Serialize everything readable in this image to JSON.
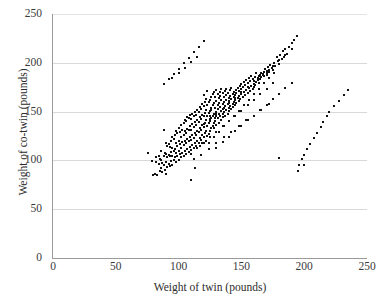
{
  "chart_data": {
    "type": "scatter",
    "title": "",
    "xlabel": "Weight of twin (pounds)",
    "ylabel": "Weight of co-twin (pounds)",
    "xlim": [
      0,
      250
    ],
    "ylim": [
      0,
      250
    ],
    "xticks": [
      0,
      50,
      100,
      150,
      200,
      250
    ],
    "yticks": [
      0,
      50,
      100,
      150,
      200,
      250
    ],
    "xtick_labels": [
      "0",
      "50",
      "100",
      "150",
      "200",
      "250"
    ],
    "ytick_labels": [
      "0",
      "50",
      "100",
      "150",
      "200",
      "250"
    ],
    "grid": {
      "horizontal": true,
      "vertical": false,
      "color": "#d9d9d9"
    },
    "legend": null,
    "marker": {
      "shape": "square",
      "size_px": 2,
      "color": "#111111"
    },
    "n_points": 452,
    "correlation_approx": 0.85,
    "x": [
      76,
      79,
      80,
      81,
      82,
      82,
      83,
      84,
      84,
      85,
      85,
      86,
      86,
      86,
      87,
      87,
      88,
      88,
      88,
      89,
      89,
      90,
      90,
      90,
      90,
      91,
      91,
      91,
      92,
      92,
      92,
      93,
      93,
      93,
      94,
      94,
      94,
      95,
      95,
      95,
      95,
      96,
      96,
      96,
      97,
      97,
      97,
      98,
      98,
      98,
      98,
      99,
      99,
      99,
      100,
      100,
      100,
      100,
      101,
      101,
      101,
      102,
      102,
      102,
      102,
      103,
      103,
      103,
      104,
      104,
      104,
      104,
      105,
      105,
      105,
      105,
      106,
      106,
      106,
      106,
      107,
      107,
      107,
      107,
      108,
      108,
      108,
      108,
      109,
      109,
      109,
      109,
      110,
      110,
      110,
      110,
      110,
      111,
      111,
      111,
      111,
      112,
      112,
      112,
      112,
      113,
      113,
      113,
      113,
      113,
      114,
      114,
      114,
      114,
      115,
      115,
      115,
      115,
      115,
      116,
      116,
      116,
      116,
      117,
      117,
      117,
      117,
      117,
      118,
      118,
      118,
      118,
      119,
      119,
      119,
      119,
      119,
      120,
      120,
      120,
      120,
      120,
      121,
      121,
      121,
      121,
      122,
      122,
      122,
      122,
      122,
      123,
      123,
      123,
      123,
      123,
      124,
      124,
      124,
      124,
      125,
      125,
      125,
      125,
      125,
      126,
      126,
      126,
      126,
      126,
      127,
      127,
      127,
      127,
      128,
      128,
      128,
      128,
      128,
      129,
      129,
      129,
      129,
      130,
      130,
      130,
      130,
      130,
      131,
      131,
      131,
      131,
      132,
      132,
      132,
      132,
      133,
      133,
      133,
      133,
      134,
      134,
      134,
      134,
      135,
      135,
      135,
      135,
      136,
      136,
      136,
      136,
      137,
      137,
      137,
      138,
      138,
      138,
      138,
      139,
      139,
      139,
      140,
      140,
      140,
      140,
      141,
      141,
      141,
      142,
      142,
      142,
      143,
      143,
      143,
      144,
      144,
      144,
      145,
      145,
      145,
      146,
      146,
      146,
      147,
      147,
      148,
      148,
      148,
      149,
      149,
      150,
      150,
      150,
      151,
      151,
      152,
      152,
      153,
      153,
      154,
      154,
      155,
      155,
      156,
      156,
      157,
      157,
      158,
      158,
      159,
      159,
      160,
      160,
      161,
      161,
      162,
      162,
      163,
      163,
      164,
      164,
      165,
      165,
      166,
      166,
      167,
      167,
      168,
      168,
      169,
      170,
      170,
      171,
      172,
      172,
      173,
      174,
      175,
      176,
      177,
      178,
      179,
      180,
      181,
      182,
      183,
      184,
      185,
      186,
      188,
      190,
      192,
      194,
      196,
      198,
      200,
      202,
      205,
      208,
      210,
      213,
      215,
      218,
      220,
      224,
      228,
      232,
      235,
      88,
      92,
      96,
      100,
      104,
      108,
      112,
      116,
      120,
      124,
      128,
      132,
      136,
      140,
      144,
      148,
      152,
      156,
      160,
      164,
      168,
      172,
      176,
      180,
      110,
      115,
      120,
      125,
      130,
      135,
      140,
      145,
      150,
      155,
      160,
      165,
      170,
      175,
      95,
      100,
      105,
      110,
      115,
      120,
      125,
      130,
      135,
      140,
      145,
      150,
      155,
      160,
      165,
      170,
      175,
      180,
      185,
      190,
      130,
      135,
      140,
      145,
      150,
      155,
      160,
      165,
      170,
      175,
      180,
      185,
      190,
      195,
      200,
      112,
      118,
      124,
      130,
      136,
      142,
      148,
      154,
      160,
      166,
      172,
      178,
      184,
      86,
      91,
      97,
      103,
      109,
      115,
      121,
      127,
      133,
      139,
      145,
      151,
      157
    ],
    "y": [
      108,
      99,
      85,
      86,
      98,
      103,
      85,
      96,
      105,
      89,
      101,
      92,
      100,
      110,
      88,
      97,
      95,
      104,
      131,
      90,
      108,
      86,
      98,
      107,
      118,
      93,
      103,
      115,
      96,
      106,
      117,
      94,
      104,
      114,
      99,
      109,
      120,
      95,
      105,
      113,
      124,
      100,
      110,
      122,
      103,
      112,
      126,
      98,
      108,
      118,
      130,
      105,
      115,
      128,
      100,
      110,
      120,
      133,
      107,
      117,
      129,
      103,
      113,
      124,
      136,
      108,
      119,
      131,
      105,
      116,
      126,
      138,
      110,
      120,
      130,
      141,
      107,
      118,
      128,
      140,
      112,
      122,
      132,
      144,
      109,
      120,
      131,
      143,
      114,
      124,
      135,
      147,
      111,
      121,
      131,
      142,
      80,
      116,
      126,
      137,
      148,
      113,
      123,
      134,
      146,
      118,
      128,
      139,
      150,
      92,
      115,
      126,
      136,
      147,
      120,
      130,
      141,
      152,
      113,
      118,
      129,
      139,
      150,
      123,
      133,
      144,
      155,
      115,
      121,
      131,
      142,
      153,
      126,
      136,
      147,
      158,
      118,
      124,
      134,
      145,
      156,
      167,
      128,
      138,
      149,
      160,
      120,
      130,
      141,
      152,
      163,
      125,
      135,
      146,
      157,
      171,
      127,
      138,
      149,
      160,
      130,
      140,
      151,
      162,
      146,
      133,
      143,
      154,
      165,
      152,
      135,
      146,
      157,
      168,
      138,
      148,
      159,
      170,
      133,
      143,
      154,
      165,
      140,
      150,
      161,
      172,
      136,
      146,
      157,
      168,
      143,
      153,
      164,
      138,
      148,
      159,
      170,
      145,
      155,
      166,
      141,
      151,
      162,
      173,
      148,
      158,
      169,
      144,
      154,
      165,
      150,
      160,
      171,
      146,
      156,
      167,
      152,
      162,
      173,
      148,
      158,
      169,
      154,
      164,
      151,
      161,
      172,
      156,
      166,
      153,
      163,
      174,
      158,
      168,
      155,
      165,
      160,
      170,
      157,
      167,
      162,
      172,
      159,
      169,
      164,
      174,
      161,
      171,
      166,
      176,
      163,
      173,
      168,
      178,
      165,
      175,
      170,
      180,
      167,
      177,
      172,
      182,
      169,
      179,
      174,
      184,
      171,
      181,
      176,
      186,
      173,
      183,
      178,
      175,
      185,
      177,
      180,
      190,
      182,
      184,
      186,
      179,
      188,
      183,
      190,
      185,
      187,
      189,
      191,
      186,
      194,
      190,
      188,
      196,
      193,
      191,
      198,
      195,
      193,
      200,
      197,
      206,
      202,
      199,
      208,
      204,
      212,
      206,
      214,
      209,
      216,
      220,
      223,
      227,
      95,
      101,
      106,
      112,
      117,
      123,
      128,
      134,
      139,
      145,
      150,
      156,
      161,
      167,
      172,
      178,
      183,
      189,
      194,
      200,
      205,
      211,
      216,
      222,
      118,
      124,
      129,
      135,
      140,
      146,
      151,
      157,
      162,
      168,
      173,
      179,
      184,
      190,
      102,
      107,
      113,
      118,
      124,
      129,
      135,
      140,
      146,
      151,
      157,
      162,
      168,
      173,
      179,
      184,
      190,
      195,
      201,
      206,
      137,
      142,
      148,
      153,
      159,
      164,
      170,
      175,
      181,
      186,
      192,
      197,
      203,
      208,
      214,
      113,
      119,
      124,
      130,
      135,
      141,
      146,
      152,
      157,
      163,
      168,
      174,
      179,
      89,
      95,
      101,
      106,
      112,
      118,
      124,
      129,
      135,
      141,
      146,
      152,
      158
    ]
  },
  "axis_titles": {
    "x": "Weight of twin (pounds)",
    "y": "Weight of co-twin (pounds)"
  }
}
